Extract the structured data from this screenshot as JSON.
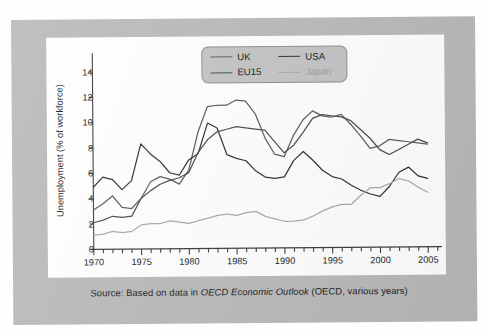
{
  "caption": {
    "prefix": "Source: Based on data in ",
    "italic": "OECD Economic Outlook",
    "suffix": " (OECD, various years)"
  },
  "colors": {
    "uk": "#5a5a5a",
    "usa": "#2f2f2f",
    "eu15": "#4a4a4a",
    "japan": "#a9a9a9",
    "axis": "#3a3a3a",
    "mount": "#b9b9b9",
    "card": "#ffffff",
    "legend_bg": "#c3c3c3",
    "text": "#15181c"
  },
  "legend": {
    "items": [
      {
        "key": "uk",
        "label": "UK"
      },
      {
        "key": "usa",
        "label": "USA"
      },
      {
        "key": "eu15",
        "label": "EU15"
      },
      {
        "key": "japan",
        "label": "Japan"
      }
    ]
  },
  "chart_data": {
    "type": "line",
    "title": "",
    "xlabel": "",
    "ylabel": "Unemployment (% of workforce)",
    "xlim": [
      1970,
      2006
    ],
    "ylim": [
      0,
      15
    ],
    "yticks": [
      0,
      2,
      4,
      6,
      8,
      10,
      12,
      14
    ],
    "xticks": [
      1970,
      1975,
      1980,
      1985,
      1990,
      1995,
      2000,
      2005
    ],
    "xtick_minor_step": 1,
    "grid": false,
    "legend_position": "top-center",
    "x": [
      1970,
      1971,
      1972,
      1973,
      1974,
      1975,
      1976,
      1977,
      1978,
      1979,
      1980,
      1981,
      1982,
      1983,
      1984,
      1985,
      1986,
      1987,
      1988,
      1989,
      1990,
      1991,
      1992,
      1993,
      1994,
      1995,
      1996,
      1997,
      1998,
      1999,
      2000,
      2001,
      2002,
      2003,
      2004,
      2005
    ],
    "series": [
      {
        "name": "UK",
        "color": "#5a5a5a",
        "values": [
          3.1,
          3.6,
          4.2,
          3.3,
          3.2,
          4.0,
          5.3,
          5.7,
          5.5,
          5.1,
          6.2,
          9.2,
          11.2,
          11.3,
          11.3,
          11.7,
          11.6,
          10.6,
          8.7,
          7.4,
          7.2,
          8.9,
          10.1,
          10.8,
          10.4,
          10.3,
          10.5,
          9.7,
          8.8,
          7.8,
          8.0,
          8.5,
          8.4,
          8.3,
          8.2,
          8.1
        ]
      },
      {
        "name": "USA",
        "color": "#2f2f2f",
        "values": [
          4.9,
          5.7,
          5.5,
          4.7,
          5.4,
          8.3,
          7.5,
          6.9,
          6.0,
          5.8,
          7.0,
          7.5,
          9.9,
          9.5,
          7.4,
          7.1,
          6.9,
          6.1,
          5.6,
          5.5,
          5.6,
          6.9,
          7.6,
          6.9,
          6.1,
          5.6,
          5.4,
          4.9,
          4.5,
          4.2,
          4.0,
          4.8,
          5.9,
          6.3,
          5.6,
          5.4
        ]
      },
      {
        "name": "EU15",
        "color": "#4a4a4a",
        "values": [
          2.1,
          2.3,
          2.6,
          2.5,
          2.6,
          4.0,
          4.6,
          5.1,
          5.4,
          5.6,
          6.0,
          7.6,
          8.6,
          9.2,
          9.4,
          9.6,
          9.5,
          9.4,
          9.3,
          8.4,
          7.5,
          8.1,
          9.1,
          10.2,
          10.5,
          10.4,
          10.3,
          10.0,
          9.3,
          8.6,
          7.7,
          7.3,
          7.7,
          8.1,
          8.5,
          8.2
        ]
      },
      {
        "name": "Japan",
        "color": "#a9a9a9",
        "values": [
          1.1,
          1.2,
          1.4,
          1.3,
          1.4,
          1.9,
          2.0,
          2.0,
          2.2,
          2.1,
          2.0,
          2.2,
          2.4,
          2.6,
          2.7,
          2.6,
          2.8,
          2.9,
          2.5,
          2.3,
          2.1,
          2.1,
          2.2,
          2.5,
          2.9,
          3.2,
          3.4,
          3.4,
          4.1,
          4.7,
          4.7,
          5.0,
          5.4,
          5.2,
          4.7,
          4.3
        ]
      }
    ]
  }
}
